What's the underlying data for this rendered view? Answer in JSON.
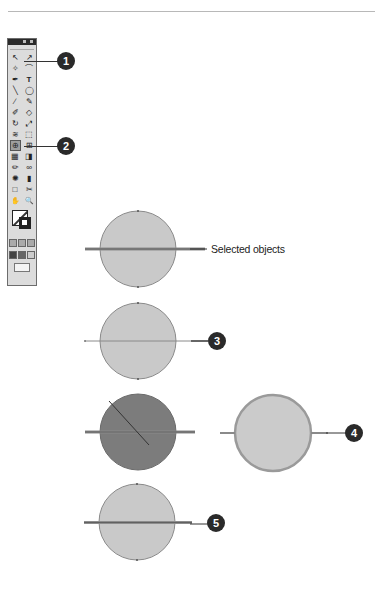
{
  "toolbox": {
    "title": "Tools",
    "rows": [
      [
        "selection-tool",
        "direct-selection-tool"
      ],
      [
        "magic-wand-tool",
        "lasso-tool"
      ],
      [
        "pen-tool",
        "type-tool"
      ],
      [
        "line-segment-tool",
        "ellipse-tool"
      ],
      [
        "paintbrush-tool",
        "pencil-tool"
      ],
      [
        "blob-brush-tool",
        "eraser-tool"
      ],
      [
        "rotate-tool",
        "scale-tool"
      ],
      [
        "warp-tool",
        "free-transform-tool"
      ],
      [
        "shape-builder-tool",
        "live-paint-selection-tool"
      ],
      [
        "mesh-tool",
        "gradient-tool"
      ],
      [
        "eyedropper-tool",
        "blend-tool"
      ],
      [
        "symbol-sprayer-tool",
        "column-graph-tool"
      ],
      [
        "artboard-tool",
        "slice-tool"
      ],
      [
        "hand-tool",
        "zoom-tool"
      ]
    ],
    "selected_tool": "live-paint-selection-tool",
    "glyphs": [
      "↖",
      "↗",
      "✧",
      "⌒",
      "✒",
      "T",
      "╲",
      "◯",
      "∕",
      "✎",
      "✐",
      "◇",
      "↻",
      "⤢",
      "≋",
      "⬚",
      "⊕",
      "⊞",
      "▦",
      "◨",
      "✏",
      "∞",
      "✺",
      "▮",
      "□",
      "✂",
      "✋",
      "🔍"
    ]
  },
  "callouts": [
    {
      "number": "1",
      "target": "direct-selection-tool"
    },
    {
      "number": "2",
      "target": "live-paint-selection-tool"
    },
    {
      "number": "3",
      "target": "step-3-line"
    },
    {
      "number": "4",
      "target": "step-4-stroke"
    },
    {
      "number": "5",
      "target": "step-5-line"
    }
  ],
  "labels": {
    "selected_objects": "Selected objects"
  },
  "colors": {
    "circle_fill": "#c9c9c9",
    "circle_dark_fill": "#7a7a7a",
    "callout_bg": "#2a2a2a",
    "stroke": "#555555"
  }
}
